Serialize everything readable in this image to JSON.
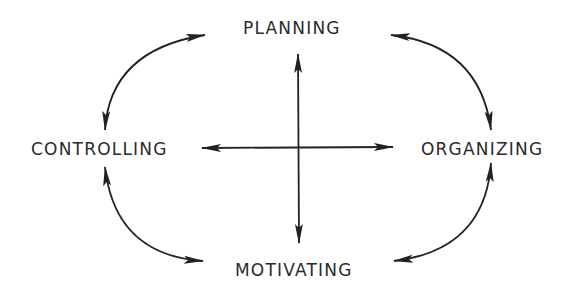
{
  "diagram": {
    "type": "management-functions-cycle",
    "nodes": {
      "top": "PLANNING",
      "right": "ORGANIZING",
      "bottom": "MOTIVATING",
      "left": "CONTROLLING"
    },
    "connections": [
      {
        "from": "PLANNING",
        "to": "ORGANIZING",
        "style": "curved-double-arrow"
      },
      {
        "from": "ORGANIZING",
        "to": "MOTIVATING",
        "style": "curved-double-arrow"
      },
      {
        "from": "MOTIVATING",
        "to": "CONTROLLING",
        "style": "curved-double-arrow"
      },
      {
        "from": "CONTROLLING",
        "to": "PLANNING",
        "style": "curved-double-arrow"
      },
      {
        "from": "PLANNING",
        "to": "MOTIVATING",
        "style": "straight-double-arrow"
      },
      {
        "from": "CONTROLLING",
        "to": "ORGANIZING",
        "style": "straight-double-arrow"
      }
    ],
    "colors": {
      "ink": "#222222",
      "background": "#ffffff"
    }
  }
}
